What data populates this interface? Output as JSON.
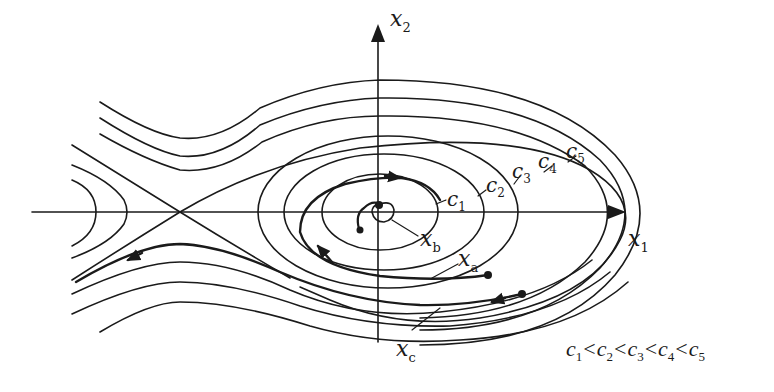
{
  "figure": {
    "type": "phase-portrait",
    "axes": {
      "x_label": "x",
      "x_sub": "1",
      "y_label": "x",
      "y_sub": "2"
    },
    "equilibria": [
      {
        "kind": "saddle",
        "position": "left of origin on x1-axis"
      },
      {
        "kind": "center / stable equilibrium",
        "position": "origin"
      }
    ],
    "level_curves": [
      {
        "name": "c",
        "sub": "1"
      },
      {
        "name": "c",
        "sub": "2"
      },
      {
        "name": "c",
        "sub": "3"
      },
      {
        "name": "c",
        "sub": "4"
      },
      {
        "name": "c",
        "sub": "5"
      }
    ],
    "trajectories": [
      {
        "name": "x",
        "sub": "a",
        "description": "starts lower right, spirals around origin"
      },
      {
        "name": "x",
        "sub": "b",
        "description": "small spiral converging near origin"
      },
      {
        "name": "x",
        "sub": "c",
        "description": "starts lower right, escapes to the left past saddle"
      }
    ],
    "inequality": {
      "terms": [
        {
          "name": "c",
          "sub": "1"
        },
        {
          "name": "c",
          "sub": "2"
        },
        {
          "name": "c",
          "sub": "3"
        },
        {
          "name": "c",
          "sub": "4"
        },
        {
          "name": "c",
          "sub": "5"
        }
      ],
      "operator": "<"
    },
    "colors": {
      "stroke": "#1a1a1a",
      "background": "#ffffff"
    }
  }
}
